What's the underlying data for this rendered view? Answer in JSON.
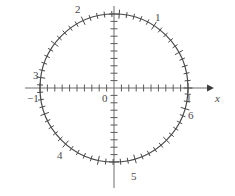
{
  "figure": {
    "background_color": "#ffffff",
    "stroke_color": "#4a4a4a",
    "axis_color": "#6e6e6e",
    "label_color": "#4a4a4a"
  },
  "axes": {
    "x_axis_label": "x",
    "origin_label": "0",
    "x_tick_labels": {
      "left": "−1",
      "right": "1"
    }
  },
  "arc_labels": [
    {
      "text": "1",
      "radians": 1
    },
    {
      "text": "2",
      "radians": 2
    },
    {
      "text": "3",
      "radians": 3
    },
    {
      "text": "4",
      "radians": 4
    },
    {
      "text": "5",
      "radians": 5
    },
    {
      "text": "6",
      "radians": 6
    }
  ],
  "chart_data": {
    "type": "scatter",
    "xlabel": "x",
    "ylabel": "",
    "xlim": [
      -1.35,
      1.35
    ],
    "ylim": [
      -1.1,
      1.1
    ],
    "grid": false,
    "legend": null,
    "circle": {
      "center": [
        0,
        0
      ],
      "radius": 1,
      "center_px": [
        114,
        88
      ],
      "radius_px": 74
    },
    "axis_ticks": {
      "x_tick_spacing": 0.1,
      "y_tick_spacing": 0.1,
      "x_labeled_ticks": [
        {
          "value": -1,
          "label": "−1"
        },
        {
          "value": 0,
          "label": "0"
        },
        {
          "value": 1,
          "label": "1"
        }
      ],
      "y_labeled_ticks": []
    },
    "circle_ticks": {
      "description": "Radial tick marks around the circumference at every 0.1 radian of arc length",
      "spacing_radians": 0.1,
      "count": 63,
      "major_every": 5
    },
    "annotations": [
      {
        "text": "1",
        "radians": 1,
        "x": 0.5403,
        "y": 0.8415
      },
      {
        "text": "2",
        "radians": 2,
        "x": -0.4161,
        "y": 0.9093
      },
      {
        "text": "3",
        "radians": 3,
        "x": -0.99,
        "y": 0.1411
      },
      {
        "text": "4",
        "radians": 4,
        "x": -0.6536,
        "y": -0.7568
      },
      {
        "text": "5",
        "radians": 5,
        "x": 0.2837,
        "y": -0.9589
      },
      {
        "text": "6",
        "radians": 6,
        "x": 0.96,
        "y": -0.2794
      }
    ]
  }
}
